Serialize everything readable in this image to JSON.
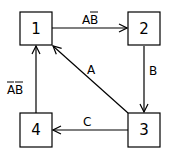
{
  "diagram": {
    "type": "state-transition",
    "states": [
      {
        "id": "1",
        "label": "1"
      },
      {
        "id": "2",
        "label": "2"
      },
      {
        "id": "3",
        "label": "3"
      },
      {
        "id": "4",
        "label": "4"
      }
    ],
    "transitions": [
      {
        "from": "1",
        "to": "2",
        "label": "AB̄",
        "parts": [
          "A",
          "B"
        ],
        "overlined": [
          false,
          true
        ]
      },
      {
        "from": "2",
        "to": "3",
        "label": "B"
      },
      {
        "from": "3",
        "to": "1",
        "label": "A"
      },
      {
        "from": "3",
        "to": "4",
        "label": "C"
      },
      {
        "from": "4",
        "to": "1",
        "label": "ĀB̄",
        "parts": [
          "A",
          "B"
        ],
        "overlined": [
          true,
          true
        ]
      }
    ]
  }
}
